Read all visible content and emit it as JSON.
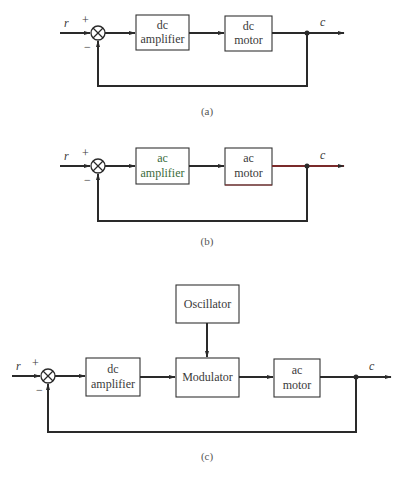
{
  "diagrams": {
    "a": {
      "caption": "(a)",
      "input_label": "r",
      "output_label": "c",
      "plus_sign": "+",
      "minus_sign": "−",
      "blocks": [
        {
          "line1": "dc",
          "line2": "amplifier"
        },
        {
          "line1": "dc",
          "line2": "motor"
        }
      ]
    },
    "b": {
      "caption": "(b)",
      "input_label": "r",
      "output_label": "c",
      "plus_sign": "+",
      "minus_sign": "−",
      "blocks": [
        {
          "line1": "ac",
          "line2": "amplifier"
        },
        {
          "line1": "ac",
          "line2": "motor"
        }
      ]
    },
    "c": {
      "caption": "(c)",
      "input_label": "r",
      "output_label": "c",
      "plus_sign": "+",
      "minus_sign": "−",
      "blocks": [
        {
          "line1": "dc",
          "line2": "amplifier"
        },
        {
          "line1": "Modulator"
        },
        {
          "line1": "ac",
          "line2": "motor"
        }
      ],
      "oscillator": {
        "label": "Oscillator"
      }
    }
  },
  "summing_junction_icon": "circle-with-x"
}
